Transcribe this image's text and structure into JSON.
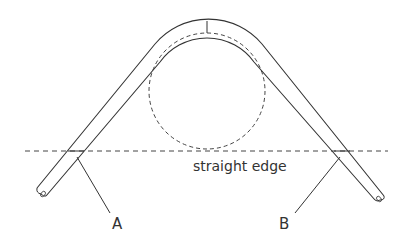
{
  "diagram": {
    "type": "bent-tube-measurement",
    "labels": {
      "straight_edge": "straight edge",
      "point_a": "A",
      "point_b": "B"
    },
    "elements": {
      "tube": "bent tube with rounded bend over circular form",
      "circle": "dashed circle representing bend radius / form",
      "straight_edge_line": "dashed horizontal reference line",
      "center_mark": "vertical tick at top of bend"
    },
    "colors": {
      "stroke": "#333333",
      "background": "#ffffff"
    }
  }
}
